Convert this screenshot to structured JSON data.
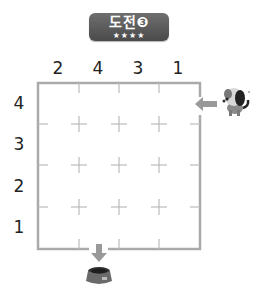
{
  "badge": {
    "title": "도전❸",
    "stars": "★★★★"
  },
  "column_labels": [
    "2",
    "4",
    "3",
    "1"
  ],
  "row_labels": [
    "4",
    "3",
    "2",
    "1"
  ],
  "grid": {
    "rows": 4,
    "cols": 4,
    "line_color": "#aaaaaa",
    "tick_color": "#bbbbbb"
  },
  "entrance": {
    "side": "right",
    "row": 1,
    "icon": "dog-icon",
    "arrow": "arrow-left-icon"
  },
  "exit": {
    "side": "bottom",
    "col": 1,
    "icon": "dog-bowl-icon",
    "arrow": "arrow-down-icon"
  }
}
